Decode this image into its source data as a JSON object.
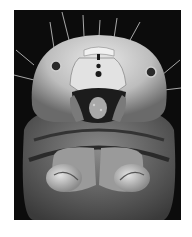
{
  "image": {
    "description": "Grayscale scanning electron micrograph of an insect larva head, front view",
    "colors": {
      "background": "#ffffff",
      "frame": "#0c0c0c",
      "head_light": "#d8d8d8",
      "head_mid": "#9a9a9a",
      "body_dark": "#5a5a5a"
    }
  }
}
